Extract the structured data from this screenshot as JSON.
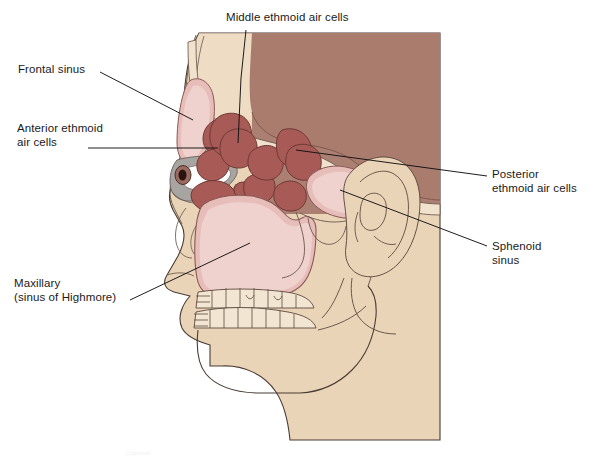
{
  "figure": {
    "credit_text": "Lippincott",
    "palette": {
      "background": "#ffffff",
      "bone": "#ead4b8",
      "bone_light": "#f0e2cd",
      "brain_block": "#a97c6e",
      "ethmoid_cell": "#a85a56",
      "ethmoid_cell_dark": "#8f4945",
      "sinus_pink": "#e6bdb9",
      "sinus_pink_light": "#efd2cd",
      "orbit_gray": "#a8a4a2",
      "outline": "#3b2f2b",
      "leader_line": "#111111",
      "label_text": "#1a1a1a",
      "pupil": "#2a1410"
    }
  },
  "labels": [
    {
      "id": "middle-ethmoid",
      "name": "label-middle-ethmoid-air-cells",
      "lines": [
        "Middle ethmoid air cells"
      ],
      "text": "Middle ethmoid air cells",
      "anchor": "top",
      "leader_from": [
        246,
        30
      ],
      "leader_to": [
        240,
        143
      ]
    },
    {
      "id": "frontal",
      "name": "label-frontal-sinus",
      "lines": [
        "Frontal sinus"
      ],
      "text": "Frontal sinus",
      "anchor": "left",
      "leader_from": [
        100,
        72
      ],
      "leader_to": [
        183,
        119
      ]
    },
    {
      "id": "anterior",
      "name": "label-anterior-ethmoid-air-cells",
      "lines": [
        "Anterior ethmoid",
        "air cells"
      ],
      "text": "Anterior ethmoid air cells",
      "anchor": "left",
      "leader_from": [
        88,
        148
      ],
      "leader_to": [
        205,
        148
      ]
    },
    {
      "id": "posterior",
      "name": "label-posterior-ethmoid-air-cells",
      "lines": [
        "Posterior",
        "ethmoid air cells"
      ],
      "text": "Posterior ethmoid air cells",
      "anchor": "right",
      "leader_from": [
        487,
        175
      ],
      "leader_to": [
        300,
        148
      ]
    },
    {
      "id": "sphenoid",
      "name": "label-sphenoid-sinus",
      "lines": [
        "Sphenoid",
        "sinus"
      ],
      "text": "Sphenoid sinus",
      "anchor": "right",
      "leader_from": [
        487,
        245
      ],
      "leader_to": [
        318,
        182
      ]
    },
    {
      "id": "maxillary",
      "name": "label-maxillary-sinus",
      "lines": [
        "Maxillary",
        "(sinus of Highmore)"
      ],
      "text": "Maxillary (sinus of Highmore)",
      "anchor": "left",
      "leader_from": [
        128,
        300
      ],
      "leader_to": [
        247,
        245
      ]
    }
  ],
  "structures": {
    "frontal_sinus": "frontal-sinus-cavity",
    "anterior_ethmoid": "anterior-ethmoid-air-cells",
    "middle_ethmoid": "middle-ethmoid-air-cells",
    "posterior_ethmoid": "posterior-ethmoid-air-cells",
    "sphenoid_sinus": "sphenoid-sinus-cavity",
    "maxillary_sinus": "maxillary-sinus-cavity",
    "orbit": "orbital-cavity",
    "eye": "eyeball",
    "ear": "external-ear-auricle",
    "teeth": "dental-arches",
    "mandible": "mandible",
    "cranium": "cranial-vault-block"
  }
}
